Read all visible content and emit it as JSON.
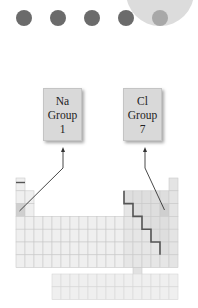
{
  "progress_dots": {
    "total": 5,
    "current": 5,
    "icons": [
      "dot-icon",
      "dot-icon",
      "dot-icon",
      "dot-icon",
      "dot-icon-active"
    ]
  },
  "labels": [
    {
      "element": "Na",
      "group_label": "Group",
      "group_number": "1"
    },
    {
      "element": "Cl",
      "group_label": "Group",
      "group_number": "7"
    }
  ],
  "periodic_table": {
    "main_rows": 7,
    "columns": 18,
    "f_block_rows": 2,
    "f_block_columns": 14,
    "highlighted_cells": [
      {
        "name": "Na",
        "row": 3,
        "col": 1
      },
      {
        "name": "Cl",
        "row": 3,
        "col": 17
      }
    ],
    "colors": {
      "cell_fill": "#efefef",
      "cell_stroke": "#c9c9c9",
      "nonmetal_fill": "#dedede",
      "highlight_fill": "#cfcfcf",
      "staircase": "#555555",
      "arrow": "#333333"
    }
  }
}
